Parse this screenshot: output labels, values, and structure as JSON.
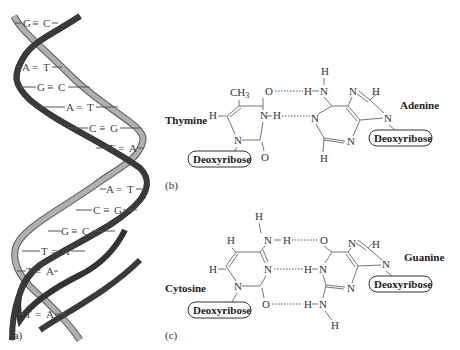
{
  "figure": {
    "panels": [
      {
        "id": "a",
        "label": "(a)"
      },
      {
        "id": "b",
        "label": "(b)"
      },
      {
        "id": "c",
        "label": "(c)"
      }
    ],
    "helix": {
      "base_pairs": [
        {
          "left": "G",
          "bond": "≡",
          "right": "C"
        },
        {
          "left": "A",
          "bond": "=",
          "right": "T"
        },
        {
          "left": "G",
          "bond": "≡",
          "right": "C"
        },
        {
          "left": "A",
          "bond": "=",
          "right": "T"
        },
        {
          "left": "C",
          "bond": "≡",
          "right": "G"
        },
        {
          "left": "T",
          "bond": "=",
          "right": "A"
        },
        {
          "left": "A",
          "bond": "=",
          "right": "T"
        },
        {
          "left": "C",
          "bond": "≡",
          "right": "G"
        },
        {
          "left": "G",
          "bond": "≡",
          "right": "C"
        },
        {
          "left": "T",
          "bond": "=",
          "right": "A"
        },
        {
          "left": "T",
          "bond": "=",
          "right": "A"
        },
        {
          "left": "T",
          "bond": "=",
          "right": "A"
        }
      ],
      "colors": {
        "dark_strand": "#3a3a3a",
        "light_strand": "#a8a8a8"
      }
    },
    "pair_b": {
      "left_base": "Thymine",
      "right_base": "Adenine",
      "sugar_left": "Deoxyribose",
      "sugar_right": "Deoxyribose",
      "atoms": {
        "ch3": "CH3",
        "o": "O",
        "n": "N",
        "h": "H"
      }
    },
    "pair_c": {
      "left_base": "Cytosine",
      "right_base": "Guanine",
      "sugar_left": "Deoxyribose",
      "sugar_right": "Deoxyribose"
    }
  }
}
